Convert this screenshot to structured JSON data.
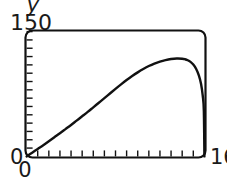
{
  "chart_data": {
    "type": "line",
    "title": "",
    "xlabel": "",
    "ylabel": "y",
    "xlim": [
      0,
      16
    ],
    "ylim": [
      0,
      150
    ],
    "grid": false,
    "legend": null,
    "axis_labels": {
      "y_max": "150",
      "y_min": "0",
      "x_min": "0",
      "x_max": "16"
    },
    "ticks": {
      "x_major": [
        "0",
        "16"
      ],
      "x_tick_count": 16,
      "x_tick_values": [
        0,
        1,
        2,
        3,
        4,
        5,
        6,
        7,
        8,
        9,
        10,
        11,
        12,
        13,
        14,
        15,
        16
      ],
      "y_major": [
        "0",
        "150"
      ],
      "y_tick_count": 15,
      "y_tick_values": [
        0,
        10,
        20,
        30,
        40,
        50,
        60,
        70,
        80,
        90,
        100,
        110,
        120,
        130,
        140,
        150
      ]
    },
    "series": [
      {
        "name": "curve",
        "color": "#111111",
        "x": [
          0,
          0.5,
          1,
          1.5,
          2,
          2.5,
          3,
          3.5,
          4,
          4.5,
          5,
          5.5,
          6,
          6.5,
          7,
          7.5,
          8,
          8.5,
          9,
          9.5,
          10,
          10.5,
          11,
          11.5,
          12,
          12.5,
          13,
          13.5,
          14,
          14.25,
          14.5,
          14.75,
          15,
          15.25,
          15.5,
          15.7,
          15.85,
          15.95,
          16
        ],
        "y": [
          0,
          4.5,
          9,
          13.5,
          18.2,
          23,
          27.8,
          32.8,
          37.8,
          43,
          48.2,
          53.5,
          59,
          64.5,
          70,
          75.6,
          81.2,
          86.6,
          91.8,
          96.6,
          101,
          105,
          108.6,
          111.6,
          114,
          115.8,
          117,
          117.6,
          117.4,
          116.8,
          115.6,
          113.6,
          110.4,
          105.4,
          97.4,
          87,
          73,
          55,
          0
        ]
      }
    ],
    "annotations": {
      "clipped_glyph": "y"
    },
    "colors": {
      "ink": "#111111",
      "background": "#ffffff",
      "text": "#1a1a1a"
    }
  }
}
